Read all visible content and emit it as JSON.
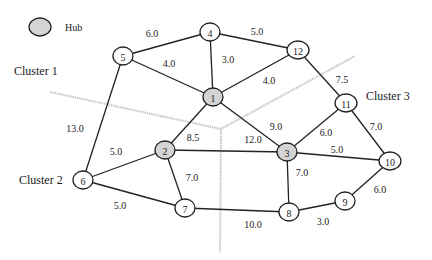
{
  "legend": {
    "hub_label": "Hub",
    "hub_fill": "#d4d4d4"
  },
  "clusters": [
    {
      "label": "Cluster 1",
      "x": 14,
      "y": 75
    },
    {
      "label": "Cluster 2",
      "x": 19,
      "y": 184
    },
    {
      "label": "Cluster 3",
      "x": 366,
      "y": 100
    }
  ],
  "colors": {
    "node_fill": "#ffffff",
    "hub_fill": "#d4d4d4",
    "edge": "#222222",
    "divider": "#c8c8c8"
  },
  "nodes": [
    {
      "id": "1",
      "x": 213,
      "y": 97,
      "hub": true
    },
    {
      "id": "2",
      "x": 165,
      "y": 150,
      "hub": true
    },
    {
      "id": "3",
      "x": 287,
      "y": 152,
      "hub": true
    },
    {
      "id": "4",
      "x": 210,
      "y": 32,
      "hub": false
    },
    {
      "id": "5",
      "x": 123,
      "y": 56,
      "hub": false
    },
    {
      "id": "6",
      "x": 83,
      "y": 180,
      "hub": false
    },
    {
      "id": "7",
      "x": 185,
      "y": 208,
      "hub": false
    },
    {
      "id": "8",
      "x": 289,
      "y": 212,
      "hub": false
    },
    {
      "id": "9",
      "x": 345,
      "y": 201,
      "hub": false
    },
    {
      "id": "10",
      "x": 390,
      "y": 161,
      "hub": false
    },
    {
      "id": "11",
      "x": 346,
      "y": 103,
      "hub": false
    },
    {
      "id": "12",
      "x": 298,
      "y": 50,
      "hub": false
    }
  ],
  "edges": [
    {
      "from": "5",
      "to": "4",
      "weight": "6.0",
      "lx": 152,
      "ly": 37
    },
    {
      "from": "4",
      "to": "12",
      "weight": "5.0",
      "lx": 257,
      "ly": 35
    },
    {
      "from": "5",
      "to": "1",
      "weight": "4.0",
      "lx": 169,
      "ly": 67
    },
    {
      "from": "4",
      "to": "1",
      "weight": "3.0",
      "lx": 228,
      "ly": 63
    },
    {
      "from": "1",
      "to": "12",
      "weight": "4.0",
      "lx": 269,
      "ly": 84
    },
    {
      "from": "12",
      "to": "11",
      "weight": "7.5",
      "lx": 342,
      "ly": 83
    },
    {
      "from": "5",
      "to": "6",
      "weight": "13.0",
      "lx": 75,
      "ly": 132
    },
    {
      "from": "1",
      "to": "2",
      "weight": "8.5",
      "lx": 193,
      "ly": 141
    },
    {
      "from": "1",
      "to": "3",
      "weight": "9.0",
      "lx": 276,
      "ly": 130
    },
    {
      "from": "2",
      "to": "3",
      "weight": "12.0",
      "lx": 253,
      "ly": 143
    },
    {
      "from": "11",
      "to": "3",
      "weight": "6.0",
      "lx": 326,
      "ly": 136
    },
    {
      "from": "11",
      "to": "10",
      "weight": "7.0",
      "lx": 376,
      "ly": 130
    },
    {
      "from": "3",
      "to": "10",
      "weight": "5.0",
      "lx": 337,
      "ly": 153
    },
    {
      "from": "6",
      "to": "2",
      "weight": "5.0",
      "lx": 116,
      "ly": 155
    },
    {
      "from": "2",
      "to": "7",
      "weight": "7.0",
      "lx": 192,
      "ly": 181
    },
    {
      "from": "3",
      "to": "8",
      "weight": "7.0",
      "lx": 302,
      "ly": 176
    },
    {
      "from": "6",
      "to": "7",
      "weight": "5.0",
      "lx": 120,
      "ly": 209
    },
    {
      "from": "7",
      "to": "8",
      "weight": "10.0",
      "lx": 253,
      "ly": 228
    },
    {
      "from": "8",
      "to": "9",
      "weight": "3.0",
      "lx": 323,
      "ly": 225
    },
    {
      "from": "9",
      "to": "10",
      "weight": "6.0",
      "lx": 380,
      "ly": 193
    }
  ],
  "dividers": [
    {
      "x1": 50,
      "y1": 92,
      "x2": 221,
      "y2": 129
    },
    {
      "x1": 221,
      "y1": 129,
      "x2": 355,
      "y2": 56
    },
    {
      "x1": 221,
      "y1": 129,
      "x2": 220,
      "y2": 252
    }
  ]
}
